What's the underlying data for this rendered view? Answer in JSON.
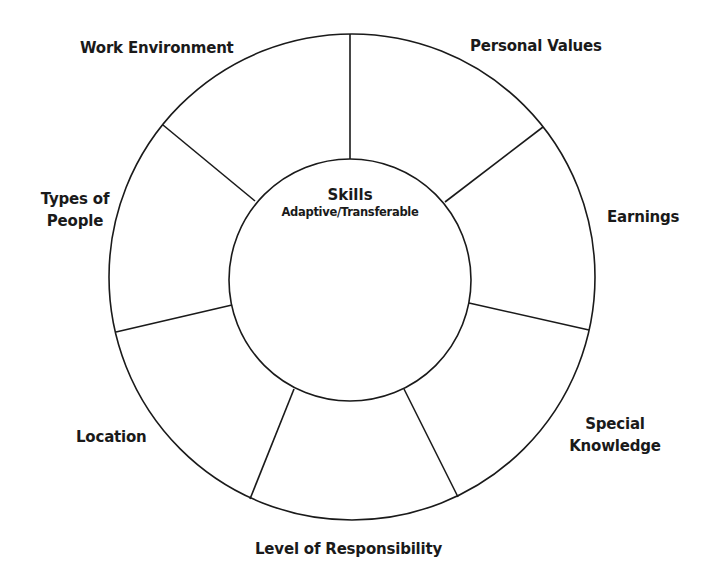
{
  "diagram": {
    "type": "wheel",
    "center": {
      "title": "Skills",
      "subtitle": "Adaptive/Transferable"
    },
    "segments": [
      {
        "label": "Personal Values"
      },
      {
        "label": "Earnings"
      },
      {
        "label": "Special",
        "label_line2": "Knowledge"
      },
      {
        "label": "Level of Responsibility"
      },
      {
        "label": "Location"
      },
      {
        "label": "Types of",
        "label_line2": "People"
      },
      {
        "label": "Work Environment"
      }
    ],
    "colors": {
      "line": "#1a1a1a",
      "background": "#ffffff",
      "text": "#1a1a1a"
    }
  }
}
